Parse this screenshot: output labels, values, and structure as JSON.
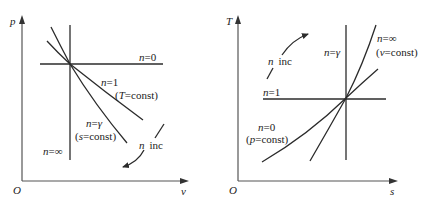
{
  "left_panel": {
    "title": "p-v diagram of polytropic processes",
    "axes": {
      "y_label": "p",
      "x_label": "v",
      "origin": "O"
    },
    "curves": [
      {
        "id": "n0",
        "n": "n",
        "eq": "=0",
        "desc": ""
      },
      {
        "id": "n1",
        "n": "n",
        "eq": "=1",
        "desc_open": "(",
        "desc_var": "T",
        "desc_rest": "=const)"
      },
      {
        "id": "ngamma",
        "n": "n",
        "eq": "=",
        "gamma": "γ",
        "desc_open": "(",
        "desc_var": "s",
        "desc_rest": "=const)"
      },
      {
        "id": "ninf",
        "n": "n",
        "eq": "=∞"
      }
    ],
    "trend": {
      "var": "n",
      "text": "inc"
    }
  },
  "right_panel": {
    "title": "T-s diagram of polytropic processes",
    "axes": {
      "y_label": "T",
      "x_label": "s",
      "origin": "O"
    },
    "curves": [
      {
        "id": "n1",
        "n": "n",
        "eq": "=1"
      },
      {
        "id": "ngamma",
        "n": "n",
        "eq": "=",
        "gamma": "γ"
      },
      {
        "id": "ninf",
        "n": "n",
        "eq": "=∞",
        "desc_open": "(",
        "desc_var": "v",
        "desc_rest": "=const)"
      },
      {
        "id": "n0",
        "n": "n",
        "eq": "=0",
        "desc_open": "(",
        "desc_var": "p",
        "desc_rest": "=const)"
      }
    ],
    "trend": {
      "var": "n",
      "text": "inc"
    }
  },
  "colors": {
    "line": "#2b2b2b",
    "axis": "#555555",
    "text": "#222222",
    "background": "#ffffff"
  }
}
